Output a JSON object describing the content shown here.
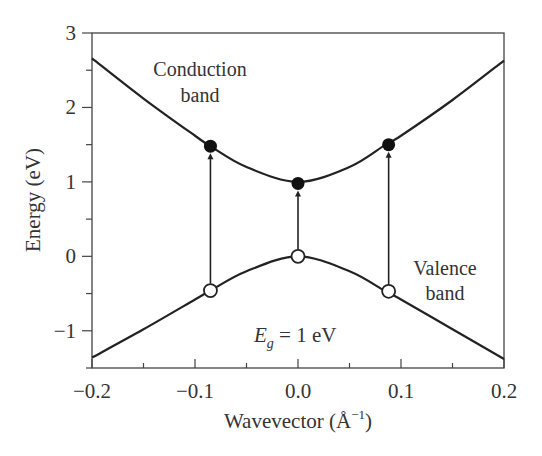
{
  "chart_data": {
    "type": "line",
    "title": "",
    "xlabel": "Wavevector (Å⁻¹)",
    "xlabel_main": "Wavevector (Å",
    "xlabel_sup": "−1",
    "xlabel_close": ")",
    "ylabel": "Energy (eV)",
    "xlim": [
      -0.2,
      0.2
    ],
    "ylim": [
      -1.5,
      3
    ],
    "xticks": [
      -0.2,
      -0.1,
      0.0,
      0.1,
      0.2
    ],
    "xtick_labels": [
      "−0.2",
      "−0.1",
      "0.0",
      "0.1",
      "0.2"
    ],
    "yticks": [
      -1,
      0,
      1,
      2,
      3
    ],
    "ytick_labels": [
      "−1",
      "0",
      "1",
      "2",
      "3"
    ],
    "grid": false,
    "series": [
      {
        "name": "Conduction band",
        "x": [
          -0.2,
          -0.15,
          -0.1,
          -0.085,
          -0.05,
          0.0,
          0.05,
          0.085,
          0.1,
          0.15,
          0.2
        ],
        "y": [
          2.66,
          2.12,
          1.62,
          1.48,
          1.2,
          1.0,
          1.2,
          1.5,
          1.62,
          2.1,
          2.63
        ]
      },
      {
        "name": "Valence band",
        "x": [
          -0.2,
          -0.15,
          -0.1,
          -0.085,
          -0.05,
          0.0,
          0.05,
          0.085,
          0.1,
          0.15,
          0.2
        ],
        "y": [
          -1.36,
          -0.98,
          -0.58,
          -0.46,
          -0.2,
          0.0,
          -0.2,
          -0.47,
          -0.58,
          -0.98,
          -1.38
        ]
      }
    ],
    "markers": {
      "filled": [
        {
          "x": -0.085,
          "y": 1.48
        },
        {
          "x": 0.0,
          "y": 0.98
        },
        {
          "x": 0.088,
          "y": 1.5
        }
      ],
      "open": [
        {
          "x": -0.085,
          "y": -0.46
        },
        {
          "x": 0.0,
          "y": 0.0
        },
        {
          "x": 0.088,
          "y": -0.47
        }
      ]
    },
    "transitions": [
      {
        "x": -0.085,
        "from": -0.46,
        "to": 1.48
      },
      {
        "x": 0.0,
        "from": 0.0,
        "to": 0.98
      },
      {
        "x": 0.088,
        "from": -0.47,
        "to": 1.5
      }
    ],
    "annotations": [
      {
        "text": "Conduction",
        "line": 1
      },
      {
        "text": "band",
        "line": 2
      },
      {
        "text": "Valence",
        "line": 1
      },
      {
        "text": "band",
        "line": 2
      },
      {
        "text": "E_g = 1 eV"
      }
    ]
  },
  "labels": {
    "conduction_1": "Conduction",
    "conduction_2": "band",
    "valence_1": "Valence",
    "valence_2": "band",
    "eg_E": "E",
    "eg_sub": "g",
    "eg_rest": " = 1 eV"
  }
}
